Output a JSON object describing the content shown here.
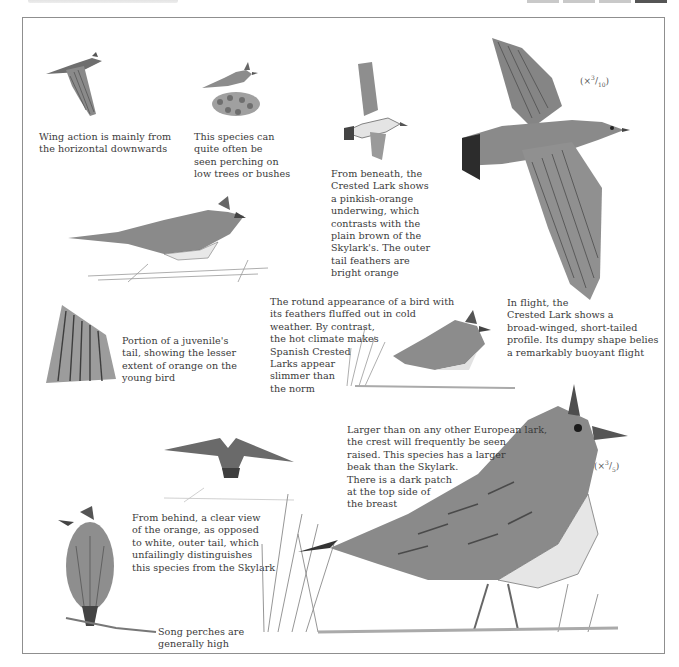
{
  "header": {
    "title_strip": "",
    "tabs": [
      {
        "active": false
      },
      {
        "active": false
      },
      {
        "active": false
      },
      {
        "active": true
      }
    ]
  },
  "scales": {
    "flight_scale": {
      "prefix": "(×",
      "num": "3",
      "den": "10",
      "suffix": ")"
    },
    "perched_scale": {
      "prefix": "(×",
      "num": "3",
      "den": "5",
      "suffix": ")"
    }
  },
  "captions": {
    "wing_action": "Wing action is mainly from\nthe horizontal downwards",
    "perching": "This species can\nquite often be\nseen perching on\nlow trees or bushes",
    "from_beneath": "From beneath, the\nCrested Lark shows\na pinkish-orange\nunderwing, which\ncontrasts with the\nplain brown of the\nSkylark's. The outer\ntail feathers are\nbright orange",
    "in_flight": "In flight, the\nCrested Lark shows a\nbroad-winged, short-tailed\nprofile. Its dumpy shape belies\na remarkably buoyant flight",
    "juvenile_tail": "Portion of a juvenile's\ntail, showing the lesser\nextent of orange on the\nyoung bird",
    "rotund": "The rotund appearance of a bird with\nits feathers fluffed out in cold\nweather. By contrast,\nthe hot climate makes\nSpanish Crested\nLarks appear\nslimmer than\nthe norm",
    "larger": "Larger than on any other European lark,\nthe crest will frequently be seen\nraised. This species has a larger\nbeak than the Skylark.\nThere is a dark patch\nat the top side of\nthe breast",
    "from_behind": "From behind, a clear view\nof the orange, as opposed\nto white, outer tail, which\nunfailingly distinguishes\nthis species from the Skylark",
    "song_perches": "Song perches are\ngenerally high"
  },
  "illustrations": [
    {
      "id": "flying-lark-small",
      "subject": "Crested Lark in flight, side view"
    },
    {
      "id": "perched-lark-bush",
      "subject": "Crested Lark perched on a bush"
    },
    {
      "id": "lark-from-beneath",
      "subject": "Crested Lark in flight seen from beneath"
    },
    {
      "id": "large-flying-lark",
      "subject": "Crested Lark in flight, top view"
    },
    {
      "id": "lark-on-ground",
      "subject": "Crested Lark standing on ground"
    },
    {
      "id": "juvenile-tail",
      "subject": "Juvenile tail feathers"
    },
    {
      "id": "rotund-lark",
      "subject": "Fluffed-out Crested Lark in grass"
    },
    {
      "id": "lark-from-behind-flight",
      "subject": "Crested Lark flying, rear view"
    },
    {
      "id": "lark-on-perch",
      "subject": "Crested Lark on a branch, from behind"
    },
    {
      "id": "large-crested-lark",
      "subject": "Large Crested Lark standing in grass"
    }
  ],
  "colors": {
    "frame": "#8f8f8f",
    "text": "#3a3a3a",
    "ink_dark": "#3d3d3d",
    "ink_mid": "#7a7a7a",
    "ink_light": "#bdbdbd"
  }
}
